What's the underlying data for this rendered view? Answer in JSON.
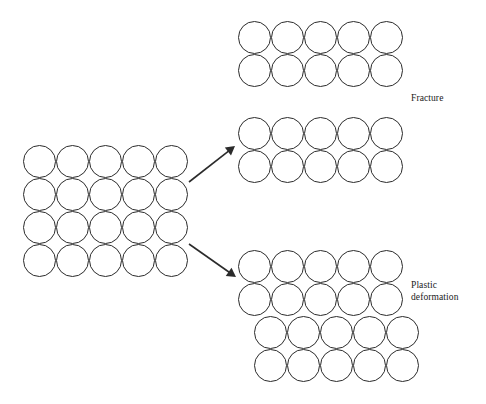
{
  "figure": {
    "type": "schematic-diagram",
    "background_color": "#ffffff",
    "stroke_color": "#2b2b2b",
    "stroke_width": 1,
    "fill_color": "none",
    "width": 486,
    "height": 404
  },
  "labels": {
    "fracture": "Fracture",
    "plastic_deformation": "Plastic\ndeformation"
  },
  "clusters": [
    {
      "id": "source-lattice",
      "name": "original-lattice",
      "rows": 4,
      "cols": 5,
      "circle_diameter": 33,
      "origin_x": 23,
      "origin_y": 145,
      "row_offsets": [
        0,
        0,
        0,
        0
      ],
      "label": null
    },
    {
      "id": "fracture-top-fragment",
      "name": "fracture-upper-fragment",
      "rows": 2,
      "cols": 5,
      "circle_diameter": 33,
      "origin_x": 238,
      "origin_y": 21,
      "row_offsets": [
        0,
        0
      ],
      "label": "Fracture"
    },
    {
      "id": "fracture-bottom-fragment",
      "name": "fracture-lower-fragment",
      "rows": 2,
      "cols": 5,
      "circle_diameter": 33,
      "origin_x": 238,
      "origin_y": 117,
      "row_offsets": [
        0,
        0
      ],
      "label": null
    },
    {
      "id": "plastic-lattice",
      "name": "slipped-lattice",
      "rows": 4,
      "cols": 5,
      "circle_diameter": 33,
      "origin_x": 238,
      "origin_y": 250,
      "row_offsets": [
        0,
        0,
        16,
        16
      ],
      "label": "Plastic deformation"
    }
  ],
  "arrows": [
    {
      "id": "arrow-to-fracture",
      "name": "arrow-fracture",
      "x1": 189,
      "y1": 182,
      "x2": 235,
      "y2": 146,
      "head_length": 9,
      "head_width": 5
    },
    {
      "id": "arrow-to-plastic",
      "name": "arrow-plastic",
      "x1": 189,
      "y1": 244,
      "x2": 236,
      "y2": 277,
      "head_length": 9,
      "head_width": 5
    }
  ]
}
